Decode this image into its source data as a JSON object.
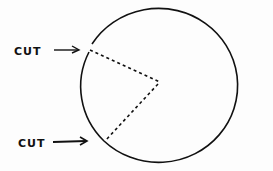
{
  "diagram": {
    "labels": {
      "cut_top": "CUT",
      "cut_bottom": "CUT"
    },
    "colors": {
      "stroke": "#111111",
      "background": "#fdfdfd"
    }
  }
}
